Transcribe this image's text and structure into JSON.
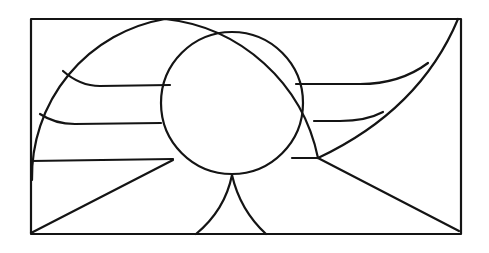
{
  "figure": {
    "type": "geometric line drawing",
    "stroke_color": "#141414",
    "background_color": "#ffffff",
    "elements": [
      "outer-rectangle",
      "large-arc",
      "inner-circle",
      "right-corner-curve",
      "left-horizontal-curves",
      "right-horizontal-curves",
      "bottom-diagonal-lines",
      "bottom-cusp-arcs"
    ]
  }
}
